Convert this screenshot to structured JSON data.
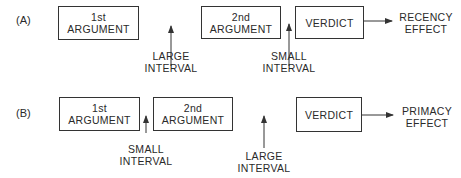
{
  "rows": [
    {
      "label": "(A)",
      "boxes": [
        {
          "line1": "1st",
          "line2": "ARGUMENT"
        },
        {
          "line1": "2nd",
          "line2": "ARGUMENT"
        },
        {
          "line1": "VERDICT"
        }
      ],
      "intervals": [
        {
          "line1": "LARGE",
          "line2": "INTERVAL"
        },
        {
          "line1": "SMALL",
          "line2": "INTERVAL"
        }
      ],
      "effect": {
        "line1": "RECENCY",
        "line2": "EFFECT"
      }
    },
    {
      "label": "(B)",
      "boxes": [
        {
          "line1": "1st",
          "line2": "ARGUMENT"
        },
        {
          "line1": "2nd",
          "line2": "ARGUMENT"
        },
        {
          "line1": "VERDICT"
        }
      ],
      "intervals": [
        {
          "line1": "SMALL",
          "line2": "INTERVAL"
        },
        {
          "line1": "LARGE",
          "line2": "INTERVAL"
        }
      ],
      "effect": {
        "line1": "PRIMACY",
        "line2": "EFFECT"
      }
    }
  ]
}
